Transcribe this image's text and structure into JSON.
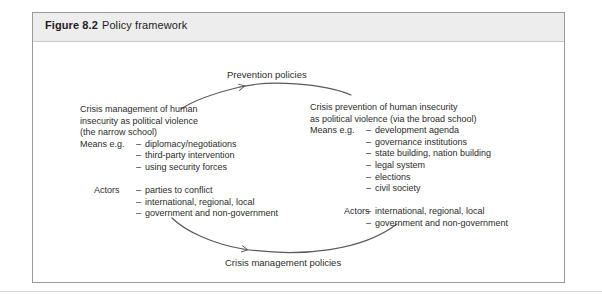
{
  "figure": {
    "number": "Figure 8.2",
    "title": "Policy framework"
  },
  "diagram": {
    "type": "cycle-diagram",
    "arrows": [
      {
        "name": "prevention-policies-arrow",
        "label": "Prevention policies",
        "direction": "right-to-left",
        "position": "top"
      },
      {
        "name": "crisis-management-policies-arrow",
        "label": "Crisis management policies",
        "direction": "left-to-right",
        "position": "bottom"
      }
    ],
    "left_block": {
      "heading": [
        "Crisis management of human",
        "insecurity as political violence",
        "(the narrow school)"
      ],
      "means": {
        "label": "Means e.g.",
        "items": [
          "diplomacy/negotiations",
          "third-party intervention",
          "using security forces"
        ]
      },
      "actors": {
        "label": "Actors",
        "items": [
          "parties to conflict",
          "international, regional, local",
          "government and non-government"
        ]
      }
    },
    "right_block": {
      "heading": [
        "Crisis prevention of human insecurity",
        "as political violence (via the broad school)"
      ],
      "means": {
        "label": "Means e.g.",
        "items": [
          "development agenda",
          "governance institutions",
          "state building, nation building",
          "legal system",
          "elections",
          "civil society"
        ]
      },
      "actors": {
        "label": "Actors",
        "items": [
          "international, regional, local",
          "government and non-government"
        ]
      }
    },
    "dash_glyph": "–"
  },
  "colors": {
    "header_background": "#ededed",
    "border": "#9a9a9a",
    "text": "#2b2b2b",
    "arc_stroke": "#5a5a5a"
  }
}
